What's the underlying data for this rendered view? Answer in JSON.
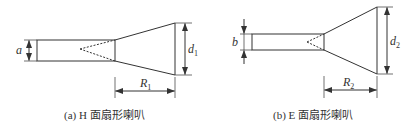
{
  "figures": [
    {
      "id": "a",
      "caption": "(a) H 面扇形喇叭",
      "dimension_labels": {
        "aperture_width": "d",
        "aperture_sub": "1",
        "length": "R",
        "length_sub": "1",
        "waveguide": "a"
      }
    },
    {
      "id": "b",
      "caption": "(b) E 面扇形喇叭",
      "dimension_labels": {
        "aperture_width": "d",
        "aperture_sub": "2",
        "length": "R",
        "length_sub": "2",
        "waveguide": "b"
      }
    }
  ],
  "colors": {
    "line": "#333333",
    "background": "#ffffff"
  }
}
